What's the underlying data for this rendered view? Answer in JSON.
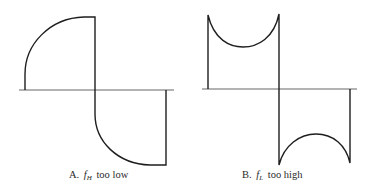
{
  "figure": {
    "stroke_color": "#1e1e1e",
    "axis_color": "#555555",
    "panels": [
      {
        "id": "A",
        "caption_prefix": "A.",
        "caption_symbol": "f",
        "caption_subscript": "H",
        "caption_suffix": "too low",
        "description": "Square wave with rounded (exponential) rising edges — high-frequency cutoff too low"
      },
      {
        "id": "B",
        "caption_prefix": "B.",
        "caption_symbol": "f",
        "caption_subscript": "L",
        "caption_suffix": "too high",
        "description": "Square wave with tilted/sagging flat tops — low-frequency cutoff too high"
      }
    ]
  }
}
